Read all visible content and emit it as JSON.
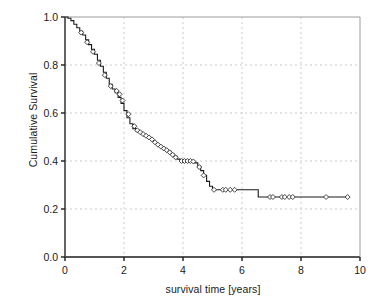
{
  "chart_data": {
    "type": "line",
    "title": "",
    "xlabel": "survival time [years]",
    "ylabel": "Cumulative Survival",
    "xlim": [
      0,
      10
    ],
    "ylim": [
      0.0,
      1.0
    ],
    "xticks": [
      0,
      2,
      4,
      6,
      8,
      10
    ],
    "xtick_labels": [
      "0",
      "2",
      "4",
      "6",
      "8",
      "10"
    ],
    "yticks": [
      0.0,
      0.2,
      0.4,
      0.6,
      0.8,
      1.0
    ],
    "ytick_labels": [
      "0.0",
      "0.2",
      "0.4",
      "0.6",
      "0.8",
      "1.0"
    ],
    "grid": true,
    "grid_style": "dashed",
    "legend": false,
    "series": [
      {
        "name": "Cumulative Survival",
        "style": "step",
        "color": "#1a1a1a",
        "marker": "diamond",
        "marker_label": "censored",
        "x": [
          0.0,
          0.1,
          0.2,
          0.3,
          0.4,
          0.5,
          0.6,
          0.7,
          0.8,
          0.9,
          1.0,
          1.1,
          1.2,
          1.3,
          1.4,
          1.5,
          1.6,
          1.7,
          1.8,
          1.9,
          2.0,
          2.1,
          2.2,
          2.3,
          2.4,
          2.5,
          2.6,
          2.7,
          2.8,
          2.9,
          3.0,
          3.1,
          3.2,
          3.3,
          3.4,
          3.5,
          3.6,
          3.7,
          3.8,
          3.9,
          4.0,
          4.1,
          4.2,
          4.3,
          4.4,
          4.5,
          4.6,
          4.7,
          4.8,
          4.9,
          5.0,
          5.5,
          6.0,
          6.45,
          6.55,
          7.0,
          8.0,
          9.0,
          9.6
        ],
        "y": [
          1.0,
          0.995,
          0.985,
          0.97,
          0.955,
          0.94,
          0.925,
          0.905,
          0.885,
          0.865,
          0.845,
          0.82,
          0.795,
          0.77,
          0.745,
          0.72,
          0.7,
          0.685,
          0.665,
          0.64,
          0.61,
          0.58,
          0.555,
          0.535,
          0.525,
          0.52,
          0.512,
          0.505,
          0.498,
          0.49,
          0.48,
          0.47,
          0.462,
          0.455,
          0.448,
          0.44,
          0.43,
          0.42,
          0.408,
          0.4,
          0.4,
          0.4,
          0.4,
          0.398,
          0.392,
          0.378,
          0.36,
          0.34,
          0.315,
          0.295,
          0.28,
          0.28,
          0.28,
          0.28,
          0.25,
          0.25,
          0.25,
          0.25,
          0.25
        ]
      }
    ],
    "censored_points": [
      {
        "x": 0.55,
        "y": 0.935
      },
      {
        "x": 0.75,
        "y": 0.895
      },
      {
        "x": 0.95,
        "y": 0.855
      },
      {
        "x": 1.15,
        "y": 0.808
      },
      {
        "x": 1.35,
        "y": 0.758
      },
      {
        "x": 1.55,
        "y": 0.712
      },
      {
        "x": 1.75,
        "y": 0.692
      },
      {
        "x": 1.85,
        "y": 0.678
      },
      {
        "x": 1.95,
        "y": 0.652
      },
      {
        "x": 2.15,
        "y": 0.595
      },
      {
        "x": 2.35,
        "y": 0.545
      },
      {
        "x": 2.45,
        "y": 0.528
      },
      {
        "x": 2.55,
        "y": 0.52
      },
      {
        "x": 2.65,
        "y": 0.512
      },
      {
        "x": 2.75,
        "y": 0.505
      },
      {
        "x": 2.85,
        "y": 0.498
      },
      {
        "x": 2.95,
        "y": 0.49
      },
      {
        "x": 3.05,
        "y": 0.478
      },
      {
        "x": 3.15,
        "y": 0.468
      },
      {
        "x": 3.25,
        "y": 0.46
      },
      {
        "x": 3.35,
        "y": 0.452
      },
      {
        "x": 3.45,
        "y": 0.445
      },
      {
        "x": 3.55,
        "y": 0.436
      },
      {
        "x": 3.65,
        "y": 0.426
      },
      {
        "x": 3.75,
        "y": 0.415
      },
      {
        "x": 3.95,
        "y": 0.4
      },
      {
        "x": 4.05,
        "y": 0.4
      },
      {
        "x": 4.15,
        "y": 0.4
      },
      {
        "x": 4.25,
        "y": 0.4
      },
      {
        "x": 4.35,
        "y": 0.398
      },
      {
        "x": 4.55,
        "y": 0.375
      },
      {
        "x": 4.7,
        "y": 0.34
      },
      {
        "x": 5.05,
        "y": 0.28
      },
      {
        "x": 5.35,
        "y": 0.28
      },
      {
        "x": 5.45,
        "y": 0.28
      },
      {
        "x": 5.6,
        "y": 0.28
      },
      {
        "x": 5.75,
        "y": 0.28
      },
      {
        "x": 6.95,
        "y": 0.25
      },
      {
        "x": 7.05,
        "y": 0.25
      },
      {
        "x": 7.35,
        "y": 0.25
      },
      {
        "x": 7.45,
        "y": 0.25
      },
      {
        "x": 7.6,
        "y": 0.25
      },
      {
        "x": 7.72,
        "y": 0.25
      },
      {
        "x": 8.85,
        "y": 0.25
      },
      {
        "x": 9.58,
        "y": 0.25
      }
    ],
    "colors": {
      "line": "#1a1a1a",
      "axis": "#555555",
      "grid": "#bfbfbf",
      "background": "#ffffff",
      "marker_fill": "#ffffff",
      "marker_stroke": "#333333"
    }
  }
}
